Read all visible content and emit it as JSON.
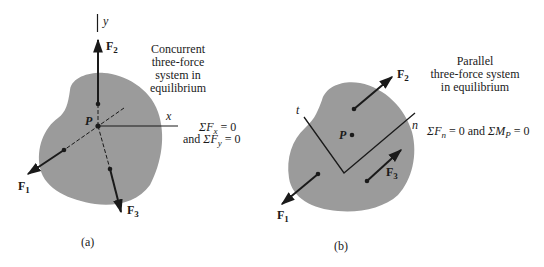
{
  "panel_a": {
    "caption": "(a)",
    "description_lines": [
      "Concurrent",
      "three-force",
      "system in",
      "equilibrium"
    ],
    "axis_x": "x",
    "axis_y": "y",
    "point": "P",
    "forces": [
      {
        "name": "F",
        "sub": "1"
      },
      {
        "name": "F",
        "sub": "2"
      },
      {
        "name": "F",
        "sub": "3"
      }
    ],
    "equation_1": {
      "sigma": "ΣF",
      "sub": "x",
      "rest": " = 0"
    },
    "equation_2": {
      "prefix": "and ",
      "sigma": "ΣF",
      "sub": "y",
      "rest": " = 0"
    }
  },
  "panel_b": {
    "caption": "(b)",
    "description_lines": [
      "Parallel",
      "three-force system",
      "in equilibrium"
    ],
    "axis_t": "t",
    "axis_n": "n",
    "point": "P",
    "forces": [
      {
        "name": "F",
        "sub": "1"
      },
      {
        "name": "F",
        "sub": "2"
      },
      {
        "name": "F",
        "sub": "3"
      }
    ],
    "equation": {
      "sigma1": "ΣF",
      "sub1": "n",
      "mid": " = 0 and ",
      "sigma2": "ΣM",
      "sub2": "P",
      "rest": " = 0"
    }
  },
  "colors": {
    "body_fill": "#9b9b9b",
    "ink": "#1a1a1a"
  }
}
